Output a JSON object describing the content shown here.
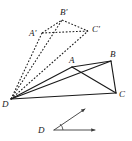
{
  "figure": {
    "canvas": {
      "width": 132,
      "height": 141,
      "background": "#ffffff"
    },
    "colors": {
      "ink": "#1a1a1a",
      "ray": "#3a3a3a",
      "background": "#ffffff"
    },
    "labels": {
      "A": "A",
      "B": "B",
      "C": "C",
      "D": "D",
      "A_prime": "A'",
      "B_prime": "B'",
      "C_prime": "C'",
      "D_vector": "D"
    },
    "points": {
      "A": {
        "x": 72,
        "y": 67
      },
      "B": {
        "x": 111,
        "y": 61
      },
      "C": {
        "x": 116,
        "y": 93
      },
      "D": {
        "x": 11,
        "y": 99
      },
      "A_prime": {
        "x": 42,
        "y": 33
      },
      "B_prime": {
        "x": 62,
        "y": 20
      },
      "C_prime": {
        "x": 88,
        "y": 31
      }
    },
    "label_positions": {
      "A": {
        "x": 69,
        "y": 63
      },
      "B": {
        "x": 110,
        "y": 57
      },
      "C": {
        "x": 119,
        "y": 97
      },
      "D": {
        "x": 2,
        "y": 107
      },
      "A_prime": {
        "x": 29,
        "y": 36
      },
      "B_prime": {
        "x": 60,
        "y": 15
      },
      "C_prime": {
        "x": 92,
        "y": 32
      },
      "D_vector": {
        "x": 38,
        "y": 131
      }
    },
    "solid_edges": [
      {
        "name": "edge-A-B",
        "from": "A",
        "to": "B"
      },
      {
        "name": "edge-B-C",
        "from": "B",
        "to": "C"
      },
      {
        "name": "edge-A-C",
        "from": "A",
        "to": "C"
      },
      {
        "name": "edge-D-A",
        "from": "D",
        "to": "A"
      },
      {
        "name": "edge-D-B",
        "from": "D",
        "to": "B"
      },
      {
        "name": "edge-D-C",
        "from": "D",
        "to": "C"
      }
    ],
    "dashed_edges": [
      {
        "name": "edge-Aprime-Bprime",
        "from": "A_prime",
        "to": "B_prime"
      },
      {
        "name": "edge-Bprime-Cprime",
        "from": "B_prime",
        "to": "C_prime"
      },
      {
        "name": "edge-Aprime-Cprime",
        "from": "A_prime",
        "to": "C_prime"
      },
      {
        "name": "edge-D-Aprime",
        "from": "D",
        "to": "A_prime"
      },
      {
        "name": "edge-D-Bprime",
        "from": "D",
        "to": "B_prime"
      },
      {
        "name": "edge-D-Cprime",
        "from": "D",
        "to": "C_prime"
      }
    ],
    "angle_diagram": {
      "vertex": {
        "x": 54,
        "y": 130
      },
      "horizontal_ray_tip": {
        "x": 97,
        "y": 130
      },
      "diagonal_ray_tip": {
        "x": 86,
        "y": 108
      },
      "arc_radius": 9,
      "label": "D"
    }
  }
}
